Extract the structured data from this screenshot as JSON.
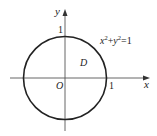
{
  "diagram": {
    "type": "coordinate-plane-unit-circle",
    "axes": {
      "x_label": "x",
      "y_label": "y",
      "origin_label": "O",
      "x_tick_label": "1",
      "y_tick_label": "1"
    },
    "curve": {
      "equation": "x²+y²=1",
      "equation_base_x": "x",
      "equation_exp_x": "2",
      "equation_plus": "+",
      "equation_base_y": "y",
      "equation_exp_y": "2",
      "equation_rhs": "=1",
      "radius": 1,
      "center": [
        0,
        0
      ]
    },
    "region_label": "D",
    "colors": {
      "stroke": "#222222",
      "axis": "#555555",
      "background": "#ffffff"
    }
  }
}
